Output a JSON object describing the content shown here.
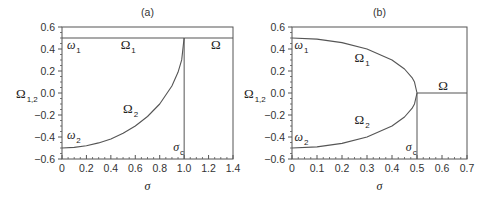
{
  "chart_data": [
    {
      "type": "line",
      "title": "(a)",
      "xlabel": "σ",
      "ylabel": "Ω",
      "ylabel_sub": "1,2",
      "xlim": [
        0,
        1.4
      ],
      "ylim": [
        -0.6,
        0.6
      ],
      "xticks": [
        0,
        0.2,
        0.4,
        0.6,
        0.8,
        1.0,
        1.2,
        1.4
      ],
      "xtick_labels": [
        "0",
        "0.2",
        "0.4",
        "0.6",
        "0.8",
        "1.0",
        "1.2",
        "1.4"
      ],
      "yticks": [
        0.6,
        0.4,
        0.2,
        0.0,
        -0.2,
        -0.4,
        -0.6
      ],
      "ytick_labels": [
        "0.6",
        "0.4",
        "0.2",
        "0.0",
        "−0.2",
        "−0.4",
        "−0.6"
      ],
      "grid": false,
      "sigma_c": 1.0,
      "series": [
        {
          "name": "Ω1",
          "x": [
            0,
            1.0
          ],
          "y": [
            0.5,
            0.5
          ]
        },
        {
          "name": "Ω2",
          "x": [
            0,
            0.1,
            0.2,
            0.3,
            0.4,
            0.5,
            0.6,
            0.7,
            0.8,
            0.9,
            0.95,
            0.98,
            1.0
          ],
          "y": [
            -0.5,
            -0.495,
            -0.48,
            -0.454,
            -0.417,
            -0.366,
            -0.3,
            -0.214,
            -0.1,
            0.064,
            0.188,
            0.301,
            0.5
          ]
        },
        {
          "name": "Ω",
          "x": [
            1.0,
            1.4
          ],
          "y": [
            0.5,
            0.5
          ]
        }
      ],
      "annotations": [
        {
          "text": "ω",
          "sub": "1",
          "x": 0.04,
          "y": 0.4
        },
        {
          "text": "Ω",
          "sub": "1",
          "x": 0.48,
          "y": 0.4
        },
        {
          "text": "Ω",
          "sub": "",
          "x": 1.22,
          "y": 0.4
        },
        {
          "text": "Ω",
          "sub": "2",
          "x": 0.5,
          "y": -0.18
        },
        {
          "text": "ω",
          "sub": "2",
          "x": 0.04,
          "y": -0.42
        },
        {
          "text": "σ",
          "sub": "c",
          "x": 0.91,
          "y": -0.53
        }
      ]
    },
    {
      "type": "line",
      "title": "(b)",
      "xlabel": "σ",
      "ylabel": "Ω",
      "ylabel_sub": "1,2",
      "xlim": [
        0,
        0.7
      ],
      "ylim": [
        -0.6,
        0.6
      ],
      "xticks": [
        0,
        0.1,
        0.2,
        0.3,
        0.4,
        0.5,
        0.6,
        0.7
      ],
      "xtick_labels": [
        "0",
        "0.1",
        "0.2",
        "0.3",
        "0.4",
        "0.5",
        "0.6",
        "0.7"
      ],
      "yticks": [
        0.6,
        0.4,
        0.2,
        0.0,
        -0.2,
        -0.4,
        -0.6
      ],
      "ytick_labels": [
        "0.6",
        "0.4",
        "0.2",
        "0.0",
        "−0.2",
        "−0.4",
        "−0.6"
      ],
      "grid": false,
      "sigma_c": 0.5,
      "series": [
        {
          "name": "Ω1",
          "x": [
            0,
            0.1,
            0.2,
            0.3,
            0.4,
            0.45,
            0.48,
            0.49,
            0.5
          ],
          "y": [
            0.5,
            0.49,
            0.458,
            0.4,
            0.3,
            0.218,
            0.14,
            0.099,
            0.0
          ]
        },
        {
          "name": "Ω2",
          "x": [
            0,
            0.1,
            0.2,
            0.3,
            0.4,
            0.45,
            0.48,
            0.49,
            0.5
          ],
          "y": [
            -0.5,
            -0.49,
            -0.458,
            -0.4,
            -0.3,
            -0.218,
            -0.14,
            -0.099,
            0.0
          ]
        },
        {
          "name": "Ω",
          "x": [
            0.5,
            0.7
          ],
          "y": [
            0.0,
            0.0
          ]
        }
      ],
      "annotations": [
        {
          "text": "ω",
          "sub": "1",
          "x": 0.01,
          "y": 0.4
        },
        {
          "text": "Ω",
          "sub": "1",
          "x": 0.25,
          "y": 0.28
        },
        {
          "text": "Ω",
          "sub": "",
          "x": 0.585,
          "y": 0.03
        },
        {
          "text": "Ω",
          "sub": "2",
          "x": 0.25,
          "y": -0.28
        },
        {
          "text": "ω",
          "sub": "2",
          "x": 0.01,
          "y": -0.44
        },
        {
          "text": "σ",
          "sub": "c",
          "x": 0.455,
          "y": -0.53
        }
      ]
    }
  ]
}
